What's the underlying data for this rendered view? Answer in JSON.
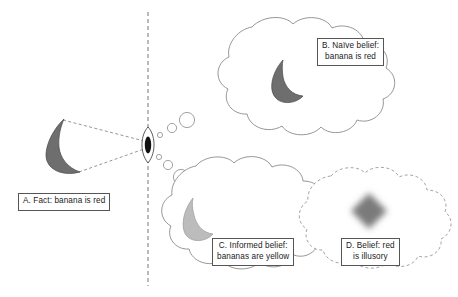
{
  "figure": {
    "title": "",
    "background_color": "#ffffff",
    "ink_color": "#555555",
    "banana_dark_color": "#6e6e6e",
    "banana_light_color": "#bcbcbc",
    "blob_color": "#7a7a7a",
    "divider": {
      "name": "vertical-dashed-divider",
      "style": "dashed",
      "x": 148,
      "y_top": 12,
      "y_bottom": 286
    }
  },
  "labels": {
    "a": {
      "id": "A",
      "lines": [
        "A. Fact: banana is red"
      ]
    },
    "b": {
      "id": "B",
      "lines": [
        "B. Naïve belief:",
        "banana is red"
      ]
    },
    "c": {
      "id": "C",
      "lines": [
        "C. Informed belief:",
        "bananas are yellow"
      ]
    },
    "d": {
      "id": "D",
      "lines": [
        "D. Belief: red",
        "is illusory"
      ]
    }
  },
  "objects": {
    "real_banana": {
      "name": "banana-shape-real",
      "fill": "#6e6e6e",
      "side": "left-of-divider",
      "description": "dark gray crescent banana"
    },
    "eye": {
      "name": "eye-icon",
      "description": "vertical almond eye with dark pupil on the divider",
      "pupil_fill": "#111111",
      "iris_fill": "#ffffff"
    },
    "naive_banana": {
      "name": "banana-shape-naive",
      "fill": "#6e6e6e",
      "in_cloud": "B"
    },
    "informed_banana": {
      "name": "banana-shape-informed",
      "fill": "#bcbcbc",
      "in_cloud": "C"
    },
    "illusory_blob": {
      "name": "blurred-diamond-blob",
      "fill": "#7a7a7a",
      "in_cloud": "D",
      "description": "soft blurred diamond representing illusory red"
    }
  },
  "clouds": [
    {
      "name": "thought-cloud-naive",
      "label": "B",
      "outline": "solid"
    },
    {
      "name": "thought-cloud-informed",
      "label": "C",
      "outline": "solid"
    },
    {
      "name": "thought-cloud-illusory",
      "label": "D",
      "outline": "dashed"
    }
  ],
  "sight_lines": {
    "name": "sight-lines",
    "style": "dashed",
    "from": "real_banana",
    "to": "eye",
    "count": 2
  }
}
